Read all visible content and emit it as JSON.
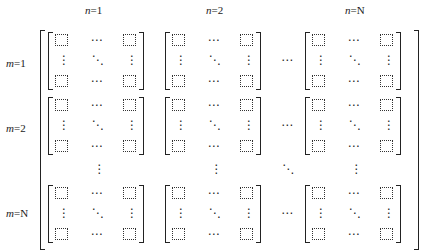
{
  "headers": {
    "columns": [
      {
        "label": "n",
        "eq": "=1"
      },
      {
        "label": "n",
        "eq": "=2"
      },
      {
        "label": "n",
        "eq": "=N"
      }
    ],
    "rows": [
      {
        "label": "m",
        "eq": "=1"
      },
      {
        "label": "m",
        "eq": "=2"
      },
      {
        "label": "m",
        "eq": "=N"
      }
    ]
  },
  "symbols": {
    "hdots": "⋯",
    "vdots": "⋮",
    "ddots": "⋱"
  },
  "layout": {
    "block_rows": [
      32,
      97,
      185
    ],
    "block_cols": [
      48,
      165,
      305
    ],
    "block_width": 97,
    "block_height": 56,
    "gap_col_x": 287,
    "gap_row_y": 169
  }
}
